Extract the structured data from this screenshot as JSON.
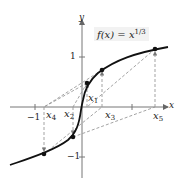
{
  "figure": {
    "title_lhs": "f(x) = x",
    "title_exponent": "1/3",
    "axis_x_label": "x",
    "axis_y_label": "y",
    "tick_labels": {
      "x_neg1": "−1",
      "y_pos1": "1",
      "y_neg1": "−1"
    },
    "point_labels": [
      {
        "name": "x",
        "sub": "1"
      },
      {
        "name": "x",
        "sub": "2"
      },
      {
        "name": "x",
        "sub": "3"
      },
      {
        "name": "x",
        "sub": "4"
      },
      {
        "name": "x",
        "sub": "5"
      }
    ],
    "colors": {
      "curve": "#111111",
      "axis": "#555555",
      "dashed": "#888888",
      "title_bg": "#f2f2f2"
    }
  }
}
